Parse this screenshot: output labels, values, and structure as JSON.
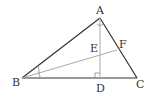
{
  "diagram": {
    "type": "geometry-triangle",
    "points": {
      "A": {
        "label": "A",
        "x": 100,
        "y": 18
      },
      "B": {
        "label": "B",
        "x": 22,
        "y": 78
      },
      "C": {
        "label": "C",
        "x": 137,
        "y": 78
      },
      "D": {
        "label": "D",
        "x": 100,
        "y": 78
      },
      "E": {
        "label": "E",
        "x": 100,
        "y": 55
      },
      "F": {
        "label": "F",
        "x": 117,
        "y": 50
      }
    },
    "segments": [
      "AB",
      "BC",
      "CA",
      "AD",
      "BF"
    ],
    "marks": [
      "right-angle at D",
      "equal angles at B (bisector BF)",
      "angle mark at A"
    ],
    "colors": {
      "main_line": "#333333",
      "aux_line": "#aaaaaa"
    }
  }
}
